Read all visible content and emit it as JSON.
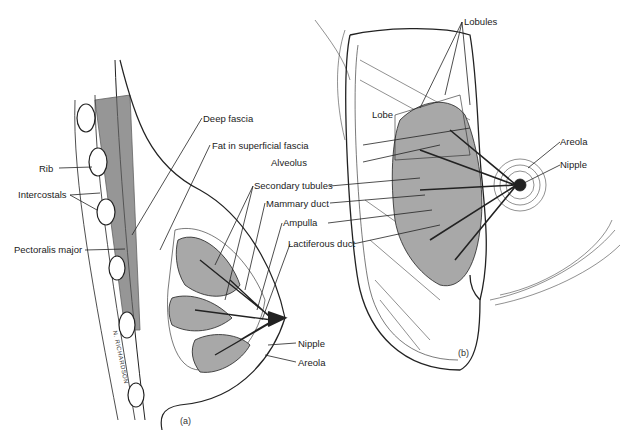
{
  "figure_a": {
    "caption": "(a)",
    "labels": {
      "deep_fascia": "Deep fascia",
      "fat_superficial_fascia": "Fat in superficial fascia",
      "rib": "Rib",
      "intercostals": "Intercostals",
      "pectoralis_major": "Pectoralis major",
      "secondary_tubules": "Secondary tubules",
      "mammary_duct": "Mammary duct",
      "ampulla": "Ampulla",
      "lactiferous_duct": "Lactiferous duct",
      "alveolus": "Alveolus",
      "nipple": "Nipple",
      "areola": "Areola"
    },
    "signature": "N. RICHARDSON"
  },
  "figure_b": {
    "caption": "(b)",
    "labels": {
      "lobules": "Lobules",
      "lobe": "Lobe",
      "areola": "Areola",
      "nipple": "Nipple"
    }
  },
  "colors": {
    "ink": "#222222",
    "gland_fill": "#a8a8a8",
    "background": "#ffffff"
  }
}
